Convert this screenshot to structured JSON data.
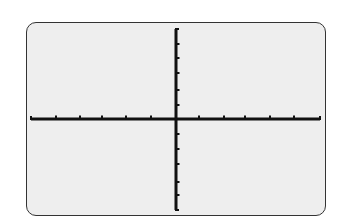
{
  "screen": {
    "background": "#eeeeee",
    "border_color": "#333333"
  },
  "chart_data": {
    "type": "line",
    "title": "",
    "xlabel": "",
    "ylabel": "",
    "series": [],
    "xlim": [
      -6,
      6
    ],
    "ylim": [
      -6,
      6
    ],
    "x_ticks": [
      -6,
      -5,
      -4,
      -3,
      -2,
      -1,
      1,
      2,
      3,
      4,
      5,
      6
    ],
    "y_ticks": [
      -6,
      -5,
      -4,
      -3,
      -2,
      -1,
      1,
      2,
      3,
      4,
      5,
      6
    ],
    "grid": false,
    "legend": null,
    "axis_color": "#111111",
    "note": "Empty graphing calculator window showing only x and y axes with tick marks"
  },
  "layout": {
    "x_axis": {
      "y": 119,
      "x_start": 31,
      "x_end": 320,
      "ticks": [
        56,
        80,
        102,
        126,
        151,
        199,
        224,
        245,
        270,
        294
      ]
    },
    "y_axis": {
      "x": 176,
      "y_start": 29,
      "y_end": 210,
      "ticks": [
        44,
        58,
        73,
        90,
        105,
        134,
        149,
        164,
        182,
        195
      ]
    }
  }
}
